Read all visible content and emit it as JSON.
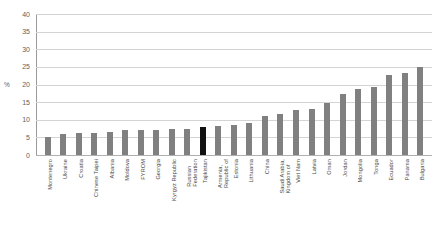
{
  "chart_data": {
    "type": "bar",
    "title": "",
    "xlabel": "",
    "ylabel": "%",
    "ylim": [
      0,
      40
    ],
    "yticks": [
      0,
      5,
      10,
      15,
      20,
      25,
      30,
      35,
      40
    ],
    "grid": true,
    "legend": "none",
    "highlight_category": "Tajikistan",
    "colors": {
      "bar": "#808080",
      "highlight_bar": "#121212",
      "gridline": "#d4d4d4",
      "axis": "#9a9a9a",
      "text": "#4a4a4a",
      "background": "#ffffff"
    },
    "categories": [
      "Montenegro",
      "Ukraine",
      "Croatia",
      "Chinese Taipei",
      "Albania",
      "Moldova",
      "FYROM",
      "Georgia",
      "Kyrgyz Republic",
      "Russian Federation",
      "Tajikistan",
      "Armenia, Republic of",
      "Estonia",
      "Lithuania",
      "China",
      "Saudi Arabia, Kingdom of",
      "Viet Nam",
      "Latvia",
      "Oman",
      "Jordan",
      "Mongolia",
      "Tonga",
      "Ecuador",
      "Panama",
      "Bulgaria"
    ],
    "category_lines": [
      [
        "Montenegro"
      ],
      [
        "Ukraine"
      ],
      [
        "Croatia"
      ],
      [
        "Chinese Taipei"
      ],
      [
        "Albania"
      ],
      [
        "Moldova"
      ],
      [
        "FYROM"
      ],
      [
        "Georgia"
      ],
      [
        "Kyrgyz Republic"
      ],
      [
        "Russian",
        "Federation"
      ],
      [
        "Tajikistan"
      ],
      [
        "Armenia,",
        "Republic of"
      ],
      [
        "Estonia"
      ],
      [
        "Lithuania"
      ],
      [
        "China"
      ],
      [
        "Saudi Arabia,",
        "Kingdom of"
      ],
      [
        "Viet Nam"
      ],
      [
        "Latvia"
      ],
      [
        "Oman"
      ],
      [
        "Jordan"
      ],
      [
        "Mongolia"
      ],
      [
        "Tonga"
      ],
      [
        "Ecuador"
      ],
      [
        "Panama"
      ],
      [
        "Bulgaria"
      ]
    ],
    "values": [
      5.2,
      5.9,
      6.2,
      6.3,
      6.4,
      7.0,
      7.1,
      7.2,
      7.3,
      7.5,
      8.0,
      8.2,
      8.4,
      9.0,
      11.0,
      11.6,
      12.8,
      13.0,
      14.8,
      17.2,
      18.6,
      19.4,
      22.8,
      23.4,
      25.0
    ]
  }
}
